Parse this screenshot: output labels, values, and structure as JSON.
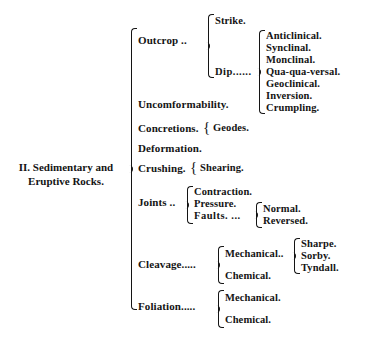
{
  "document": {
    "type": "classification-tree",
    "title": "II. Sedimentary and Eruptive Rocks.",
    "root": {
      "label": "II.  Sedimentary and\nEruptive Rocks."
    },
    "nodes": {
      "outcrop": "Outcrop ..",
      "strike": "Strike.",
      "dip": "Dip......",
      "anticlinical": "Anticlinical.",
      "synclinal": "Synclinal.",
      "monclinal": "Monclinal.",
      "quaquaversal": "Qua-qua-versal.",
      "geoclinical": "Geoclinical.",
      "inversion": "Inversion.",
      "crumpling": "Crumpling.",
      "uncomformability": "Uncomformability.",
      "concretions": "Concretions.",
      "geodes": "Geodes.",
      "deformation": "Deformation.",
      "crushing": "Crushing.",
      "shearing": "Shearing.",
      "joints": "Joints ..",
      "contraction": "Contraction.",
      "pressure": "Pressure.",
      "faults": "Faults.  ...",
      "normal": "Normal.",
      "reversed": "Reversed.",
      "cleavage": "Cleavage.....",
      "cleavage_mechanical": "Mechanical..",
      "cleavage_chemical": "Chemical.",
      "sharpe": "Sharpe.",
      "sorby": "Sorby.",
      "tyndall": "Tyndall.",
      "foliation": "Foliation.....",
      "foliation_mechanical": "Mechanical.",
      "foliation_chemical": "Chemical."
    },
    "brace_glyph": "{",
    "colors": {
      "ink": "#141414",
      "paper": "#ffffff"
    }
  }
}
